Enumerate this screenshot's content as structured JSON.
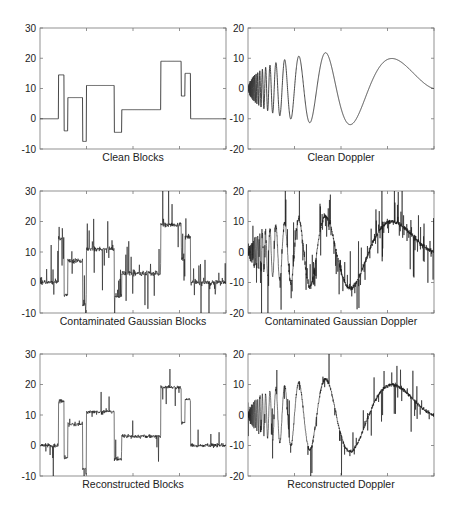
{
  "figure": {
    "width": 458,
    "height": 508,
    "line_color": "#1a1a1a",
    "axis_color": "#777777"
  },
  "chart_data": [
    {
      "id": "clean-blocks",
      "type": "line",
      "title": "Clean Blocks",
      "xlabel": "",
      "ylabel": "",
      "signal": "blocks",
      "noise": "none",
      "ylim": [
        -10,
        30
      ],
      "yticks": [
        -10,
        0,
        10,
        20,
        30
      ],
      "xlim": [
        0,
        1
      ],
      "grid": false,
      "box": {
        "x": 40,
        "y": 28,
        "w": 186,
        "h": 121
      },
      "steps": [
        {
          "x0": 0.0,
          "x1": 0.1,
          "y": 0
        },
        {
          "x0": 0.1,
          "x1": 0.13,
          "y": 14.5
        },
        {
          "x0": 0.13,
          "x1": 0.15,
          "y": -4
        },
        {
          "x0": 0.15,
          "x1": 0.23,
          "y": 7
        },
        {
          "x0": 0.23,
          "x1": 0.25,
          "y": -7.5
        },
        {
          "x0": 0.25,
          "x1": 0.4,
          "y": 11
        },
        {
          "x0": 0.4,
          "x1": 0.44,
          "y": -4.5
        },
        {
          "x0": 0.44,
          "x1": 0.65,
          "y": 3
        },
        {
          "x0": 0.65,
          "x1": 0.76,
          "y": 19
        },
        {
          "x0": 0.76,
          "x1": 0.78,
          "y": 7.5
        },
        {
          "x0": 0.78,
          "x1": 0.81,
          "y": 15
        },
        {
          "x0": 0.81,
          "x1": 1.0,
          "y": 0
        }
      ]
    },
    {
      "id": "clean-doppler",
      "type": "line",
      "title": "Clean Doppler",
      "xlabel": "",
      "ylabel": "",
      "signal": "doppler",
      "noise": "none",
      "ylim": [
        -20,
        20
      ],
      "yticks": [
        -20,
        -10,
        0,
        10,
        20
      ],
      "xlim": [
        0,
        1
      ],
      "grid": false,
      "box": {
        "x": 248,
        "y": 28,
        "w": 186,
        "h": 121
      },
      "doppler": {
        "amplitude": 24,
        "eps": 0.05
      }
    },
    {
      "id": "contaminated-blocks",
      "type": "line",
      "title": "Contaminated Gaussian Blocks",
      "xlabel": "",
      "ylabel": "",
      "signal": "blocks",
      "noise": "contaminated",
      "ylim": [
        -10,
        30
      ],
      "yticks": [
        -10,
        0,
        10,
        20,
        30
      ],
      "xlim": [
        0,
        1
      ],
      "grid": false,
      "box": {
        "x": 40,
        "y": 191,
        "w": 186,
        "h": 122
      },
      "noise_params": {
        "sigma": 0.4,
        "spike_prob": 0.12,
        "spike_scale": 6,
        "seed": 7
      }
    },
    {
      "id": "contaminated-doppler",
      "type": "line",
      "title": "Contaminated Gaussian Doppler",
      "xlabel": "",
      "ylabel": "",
      "signal": "doppler",
      "noise": "contaminated",
      "ylim": [
        -20,
        20
      ],
      "yticks": [
        -20,
        -10,
        0,
        10,
        20
      ],
      "xlim": [
        0,
        1
      ],
      "grid": false,
      "box": {
        "x": 248,
        "y": 191,
        "w": 186,
        "h": 122
      },
      "noise_params": {
        "sigma": 0.4,
        "spike_prob": 0.12,
        "spike_scale": 6,
        "seed": 11
      }
    },
    {
      "id": "reconstructed-blocks",
      "type": "line",
      "title": "Reconstructed Blocks",
      "xlabel": "",
      "ylabel": "",
      "signal": "blocks",
      "noise": "reconstructed",
      "ylim": [
        -10,
        30
      ],
      "yticks": [
        -10,
        0,
        10,
        20,
        30
      ],
      "xlim": [
        0,
        1
      ],
      "grid": false,
      "box": {
        "x": 40,
        "y": 354,
        "w": 186,
        "h": 122
      },
      "noise_params": {
        "sigma": 0.3,
        "spike_prob": 0.05,
        "spike_scale": 6,
        "seed": 23
      }
    },
    {
      "id": "reconstructed-doppler",
      "type": "line",
      "title": "Reconstructed Doppler",
      "xlabel": "",
      "ylabel": "",
      "signal": "doppler",
      "noise": "reconstructed",
      "ylim": [
        -20,
        20
      ],
      "yticks": [
        -20,
        -10,
        0,
        10,
        20
      ],
      "xlim": [
        0,
        1
      ],
      "grid": false,
      "box": {
        "x": 248,
        "y": 354,
        "w": 186,
        "h": 122
      },
      "noise_params": {
        "sigma": 0.3,
        "spike_prob": 0.06,
        "spike_scale": 6,
        "seed": 31
      }
    }
  ]
}
